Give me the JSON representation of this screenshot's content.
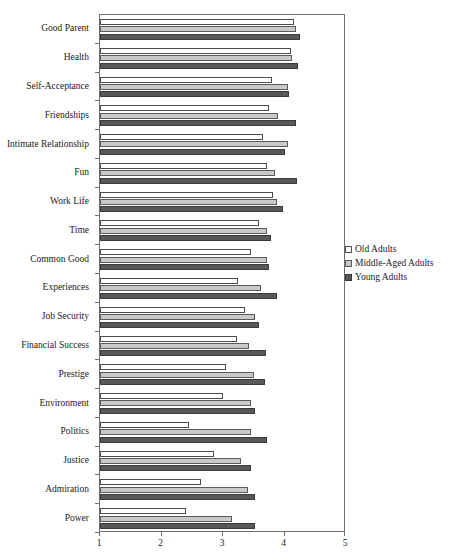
{
  "chart_data": {
    "type": "bar",
    "orientation": "horizontal",
    "title": "",
    "subtitle": "",
    "xlabel": "",
    "ylabel": "",
    "xlim": [
      1,
      5
    ],
    "xticks": [
      1,
      2,
      3,
      4,
      5
    ],
    "xticklabels": [
      "1",
      "2",
      "3",
      "4",
      "5"
    ],
    "grid": false,
    "legend_position": "right",
    "categories": [
      "Good Parent",
      "Health",
      "Self-Acceptance",
      "Friendships",
      "Intimate Relationship",
      "Fun",
      "Work Life",
      "Time",
      "Common Good",
      "Experiences",
      "Job Security",
      "Financial Success",
      "Prestige",
      "Environment",
      "Politics",
      "Justice",
      "Admiration",
      "Power"
    ],
    "series": [
      {
        "name": "Old Adults",
        "color": "#ffffff",
        "values": [
          4.15,
          4.1,
          3.8,
          3.75,
          3.65,
          3.72,
          3.82,
          3.58,
          3.45,
          3.25,
          3.35,
          3.22,
          3.05,
          3.0,
          2.45,
          2.85,
          2.65,
          2.4
        ]
      },
      {
        "name": "Middle-Aged Adults",
        "color": "#c9c9c9",
        "values": [
          4.18,
          4.12,
          4.05,
          3.9,
          4.05,
          3.85,
          3.88,
          3.72,
          3.72,
          3.62,
          3.52,
          3.42,
          3.5,
          3.45,
          3.45,
          3.3,
          3.4,
          3.15
        ]
      },
      {
        "name": "Young Adults",
        "color": "#585858",
        "values": [
          4.25,
          4.22,
          4.08,
          4.18,
          4.0,
          4.2,
          3.98,
          3.78,
          3.75,
          3.88,
          3.58,
          3.7,
          3.68,
          3.52,
          3.72,
          3.45,
          3.52,
          3.52
        ]
      }
    ]
  },
  "legend": {
    "items": [
      {
        "label": "Old Adults",
        "key": "old"
      },
      {
        "label": "Middle-Aged Adults",
        "key": "mid"
      },
      {
        "label": "Young Adults",
        "key": "young"
      }
    ]
  }
}
